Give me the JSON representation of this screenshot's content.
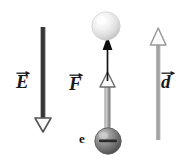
{
  "figure": {
    "background_color": "#ffffff",
    "width": 188,
    "height": 162
  },
  "labels": {
    "electric_field": {
      "symbol": "E",
      "accent": "vector-arrow"
    },
    "force": {
      "symbol": "F",
      "accent": "vector-arrow"
    },
    "displacement": {
      "symbol": "d",
      "accent": "vector-arrow"
    },
    "electron": {
      "symbol": "e",
      "accent": "none"
    },
    "charge_sign": "−"
  },
  "vectors": [
    {
      "name": "electric-field-arrow",
      "label": "E",
      "direction": "down",
      "color": "#4a4a4a",
      "head_style": "hollow-triangle",
      "x": 43,
      "y_start": 27,
      "y_end": 131
    },
    {
      "name": "force-arrow",
      "label": "F",
      "direction": "up",
      "color": "#7d7d7d",
      "head_style": "hollow-triangle",
      "x": 108,
      "y_start": 136,
      "y_end": 74
    },
    {
      "name": "motion-arrow",
      "label": "",
      "direction": "up",
      "color": "#111111",
      "head_style": "solid-triangle",
      "x": 108,
      "y_start": 80,
      "y_end": 38
    },
    {
      "name": "displacement-arrow",
      "label": "d",
      "direction": "up",
      "color": "#a8a8a8",
      "head_style": "hollow-triangle",
      "x": 158,
      "y_start": 140,
      "y_end": 29
    }
  ],
  "spheres": [
    {
      "name": "target-sphere",
      "fill": "#e8e8e8",
      "highlight": "#fdfdfd",
      "cx": 106,
      "cy": 26,
      "r": 14,
      "charge": ""
    },
    {
      "name": "electron-sphere",
      "fill": "#6e6e6e",
      "highlight": "#b6b6b6",
      "cx": 108,
      "cy": 141,
      "r": 13,
      "charge": "−"
    }
  ]
}
